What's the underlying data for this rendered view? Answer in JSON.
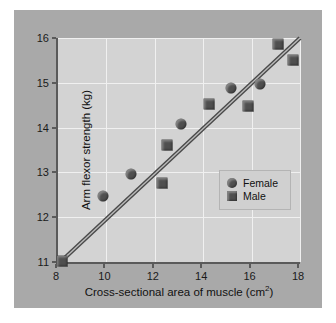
{
  "chart_data": {
    "type": "scatter",
    "title": "",
    "xlabel": "Cross-sectional area of muscle (cm2)",
    "xlabel_main": "Cross-sectional area of muscle (cm",
    "xlabel_sup": "2",
    "xlabel_close": ")",
    "ylabel": "Arm flexor strength (kg)",
    "xlim": [
      8,
      18
    ],
    "ylim": [
      11,
      16
    ],
    "xticks": [
      8,
      10,
      12,
      14,
      16,
      18
    ],
    "yticks": [
      11,
      12,
      13,
      14,
      15,
      16
    ],
    "grid": true,
    "legend_position": "inside-lower-right",
    "series": [
      {
        "name": "Female",
        "marker": "circle",
        "color": "#4f4f4f",
        "points": [
          {
            "x": 9.85,
            "y": 12.47
          },
          {
            "x": 11.0,
            "y": 12.97
          },
          {
            "x": 13.1,
            "y": 14.07
          },
          {
            "x": 15.15,
            "y": 14.88
          },
          {
            "x": 16.35,
            "y": 14.97
          }
        ]
      },
      {
        "name": "Male",
        "marker": "square",
        "color": "#4f4f4f",
        "points": [
          {
            "x": 8.15,
            "y": 11.02
          },
          {
            "x": 12.3,
            "y": 12.76
          },
          {
            "x": 12.5,
            "y": 13.62
          },
          {
            "x": 14.25,
            "y": 14.52
          },
          {
            "x": 15.85,
            "y": 14.48
          },
          {
            "x": 17.1,
            "y": 15.86
          },
          {
            "x": 17.7,
            "y": 15.52
          }
        ]
      }
    ],
    "trendline": {
      "name": "regression-line",
      "color": "#4a4a4a",
      "x0": 8.1,
      "y0": 11.0,
      "x1": 18.0,
      "y1": 16.0
    },
    "colors": {
      "figure_background": "#a9a9a9",
      "plot_background": "#d3d3d3",
      "gridline": "#f0f0f0",
      "axis": "#5a5a5a",
      "marker": "#4f4f4f",
      "page": "#ffffff"
    }
  },
  "legend": {
    "items": [
      {
        "label": "Female",
        "marker": "circle"
      },
      {
        "label": "Male",
        "marker": "square"
      }
    ]
  }
}
